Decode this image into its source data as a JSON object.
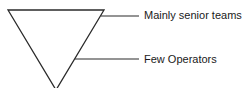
{
  "diagram": {
    "type": "inverted-triangle",
    "stroke_color": "#2a2a2a",
    "labels": [
      {
        "text": "Mainly senior teams"
      },
      {
        "text": "Few Operators"
      }
    ]
  }
}
